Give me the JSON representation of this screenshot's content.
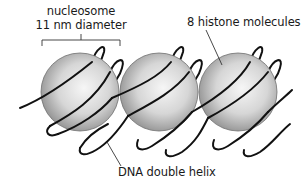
{
  "diagram": {
    "labels": {
      "nucleosome_line1": "nucleosome",
      "nucleosome_line2": "11 nm diameter",
      "histone": "8 histone molecules",
      "dna": "DNA double helix"
    },
    "nodes": [
      {
        "id": "nucleosome-1",
        "type": "sphere",
        "cx": 80,
        "cy": 92,
        "r": 39
      },
      {
        "id": "nucleosome-2",
        "type": "sphere",
        "cx": 159,
        "cy": 92,
        "r": 39
      },
      {
        "id": "nucleosome-3",
        "type": "sphere",
        "cx": 238,
        "cy": 92,
        "r": 39
      }
    ],
    "edges": [
      {
        "from": "label-nucleosome",
        "to": "nucleosome-1",
        "kind": "bracket"
      },
      {
        "from": "label-histone",
        "to": "nucleosome-3",
        "kind": "leader-line"
      },
      {
        "from": "label-dna",
        "to": "dna-helix",
        "kind": "leader-line"
      }
    ],
    "colors": {
      "sphere_light": "#f4f4f4",
      "sphere_dark": "#9a9a9a",
      "dna": "#111111",
      "text": "#1a1a1a"
    }
  }
}
